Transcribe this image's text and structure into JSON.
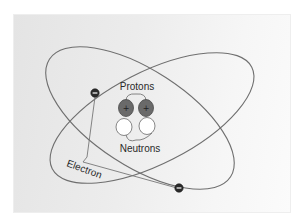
{
  "diagram": {
    "labels": {
      "protons": "Protons",
      "neutrons": "Neutrons",
      "electron": "Electron"
    },
    "charges": {
      "proton": "+",
      "electron": "−"
    },
    "colors": {
      "background": "#ebebeb",
      "orbit": "#6f6f6f",
      "proton_fill": "#6a6a6a",
      "neutron_fill": "#ffffff",
      "electron_fill": "#2b2b2b",
      "text": "#2a2a2a"
    },
    "counts": {
      "protons": 2,
      "neutrons": 2,
      "electrons": 2,
      "orbits": 2
    }
  }
}
